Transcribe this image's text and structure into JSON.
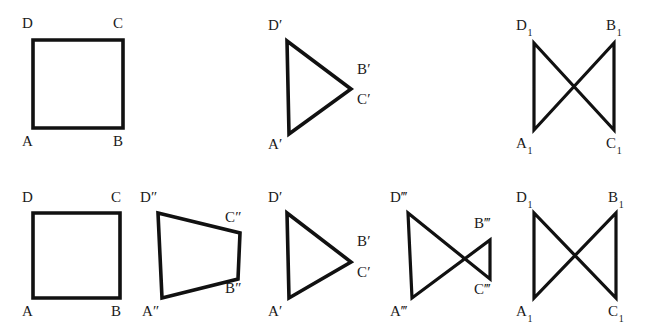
{
  "figure": {
    "background_color": "#ffffff",
    "stroke_color": "#111111",
    "label_color": "#1a1a1a",
    "width": 656,
    "height": 326
  },
  "shapes": [
    {
      "name": "square-abcd-top",
      "kind": "square",
      "row": "top",
      "path": "M 33 40 L 123 40 L 123 128 L 33 128 Z",
      "labels": [
        {
          "name": "label-d",
          "text": "D",
          "sub": "",
          "primes": "",
          "x": 22,
          "y": 16
        },
        {
          "name": "label-c",
          "text": "C",
          "sub": "",
          "primes": "",
          "x": 113,
          "y": 16
        },
        {
          "name": "label-a",
          "text": "A",
          "sub": "",
          "primes": "",
          "x": 22,
          "y": 134
        },
        {
          "name": "label-b",
          "text": "B",
          "sub": "",
          "primes": "",
          "x": 113,
          "y": 134
        }
      ]
    },
    {
      "name": "triangle-prime-top",
      "kind": "triangle",
      "row": "top",
      "path": "M 287 41 L 351 89 L 289 134 Z",
      "labels": [
        {
          "name": "label-d-prime",
          "text": "D",
          "sub": "",
          "primes": "′",
          "x": 268,
          "y": 18
        },
        {
          "name": "label-b-prime",
          "text": "B",
          "sub": "",
          "primes": "′",
          "x": 357,
          "y": 62
        },
        {
          "name": "label-c-prime",
          "text": "C",
          "sub": "",
          "primes": "′",
          "x": 357,
          "y": 92
        },
        {
          "name": "label-a-prime",
          "text": "A",
          "sub": "",
          "primes": "′",
          "x": 268,
          "y": 137
        }
      ]
    },
    {
      "name": "bowtie-sub1-top",
      "kind": "bowtie",
      "row": "top",
      "path": "M 534 43 L 534 130 L 614 43 L 614 130 Z",
      "labels": [
        {
          "name": "label-d-sub1",
          "text": "D",
          "sub": "1",
          "primes": "",
          "x": 516,
          "y": 18
        },
        {
          "name": "label-b-sub1",
          "text": "B",
          "sub": "1",
          "primes": "",
          "x": 606,
          "y": 18
        },
        {
          "name": "label-a-sub1",
          "text": "A",
          "sub": "1",
          "primes": "",
          "x": 516,
          "y": 136
        },
        {
          "name": "label-c-sub1",
          "text": "C",
          "sub": "1",
          "primes": "",
          "x": 606,
          "y": 136
        }
      ]
    },
    {
      "name": "square-abcd-bottom",
      "kind": "square",
      "row": "bottom",
      "path": "M 33 213 L 120 213 L 120 298 L 33 298 Z",
      "labels": [
        {
          "name": "label-d",
          "text": "D",
          "sub": "",
          "primes": "",
          "x": 22,
          "y": 190
        },
        {
          "name": "label-c",
          "text": "C",
          "sub": "",
          "primes": "",
          "x": 111,
          "y": 190
        },
        {
          "name": "label-a",
          "text": "A",
          "sub": "",
          "primes": "",
          "x": 22,
          "y": 304
        },
        {
          "name": "label-b",
          "text": "B",
          "sub": "",
          "primes": "",
          "x": 111,
          "y": 304
        }
      ]
    },
    {
      "name": "trapezoid-double-prime",
      "kind": "trapezoid",
      "row": "bottom",
      "path": "M 158 213 L 240 233 L 238 279 L 162 298 Z",
      "labels": [
        {
          "name": "label-d-double-prime",
          "text": "D",
          "sub": "",
          "primes": "″",
          "x": 140,
          "y": 190
        },
        {
          "name": "label-c-double-prime",
          "text": "C",
          "sub": "",
          "primes": "″",
          "x": 225,
          "y": 210
        },
        {
          "name": "label-b-double-prime",
          "text": "B",
          "sub": "",
          "primes": "″",
          "x": 225,
          "y": 281
        },
        {
          "name": "label-a-double-prime",
          "text": "A",
          "sub": "",
          "primes": "″",
          "x": 142,
          "y": 304
        }
      ]
    },
    {
      "name": "triangle-prime-bottom",
      "kind": "triangle",
      "row": "bottom",
      "path": "M 287 213 L 351 262 L 289 298 Z",
      "labels": [
        {
          "name": "label-d-prime",
          "text": "D",
          "sub": "",
          "primes": "′",
          "x": 268,
          "y": 190
        },
        {
          "name": "label-b-prime",
          "text": "B",
          "sub": "",
          "primes": "′",
          "x": 357,
          "y": 234
        },
        {
          "name": "label-c-prime",
          "text": "C",
          "sub": "",
          "primes": "′",
          "x": 357,
          "y": 265
        },
        {
          "name": "label-a-prime",
          "text": "A",
          "sub": "",
          "primes": "′",
          "x": 268,
          "y": 304
        }
      ]
    },
    {
      "name": "bowtie-triple-prime",
      "kind": "bowtie",
      "row": "bottom",
      "path": "M 408 213 L 412 298 L 490 240 L 490 279 Z",
      "labels": [
        {
          "name": "label-d-triple-prime",
          "text": "D",
          "sub": "",
          "primes": "‴",
          "x": 390,
          "y": 190
        },
        {
          "name": "label-b-triple-prime",
          "text": "B",
          "sub": "",
          "primes": "‴",
          "x": 474,
          "y": 216
        },
        {
          "name": "label-c-triple-prime",
          "text": "C",
          "sub": "",
          "primes": "‴",
          "x": 474,
          "y": 282
        },
        {
          "name": "label-a-triple-prime",
          "text": "A",
          "sub": "",
          "primes": "‴",
          "x": 390,
          "y": 304
        }
      ]
    },
    {
      "name": "bowtie-sub1-bottom",
      "kind": "bowtie",
      "row": "bottom",
      "path": "M 534 213 L 534 298 L 616 213 L 616 298 Z",
      "labels": [
        {
          "name": "label-d-sub1",
          "text": "D",
          "sub": "1",
          "primes": "",
          "x": 516,
          "y": 190
        },
        {
          "name": "label-b-sub1",
          "text": "B",
          "sub": "1",
          "primes": "",
          "x": 608,
          "y": 190
        },
        {
          "name": "label-a-sub1",
          "text": "A",
          "sub": "1",
          "primes": "",
          "x": 516,
          "y": 304
        },
        {
          "name": "label-c-sub1",
          "text": "C",
          "sub": "1",
          "primes": "",
          "x": 608,
          "y": 304
        }
      ]
    }
  ]
}
